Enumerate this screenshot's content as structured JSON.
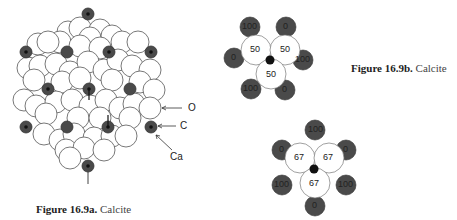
{
  "figure_a": {
    "caption_bold": "Figure 16.9a.",
    "caption_text": "Calcite",
    "labels": {
      "oxygen": "O",
      "carbon": "C",
      "calcium": "Ca"
    },
    "colors": {
      "oxygen_fill": "#ffffff",
      "oxygen_stroke": "#555555",
      "calcium_fill": "#4a4a4a",
      "carbon_fill": "#111111"
    }
  },
  "figure_b": {
    "caption_bold": "Figure 16.9b.",
    "caption_text": "Calcite",
    "top_diagram": {
      "oxygen_values": [
        "50",
        "50",
        "50"
      ],
      "calcium_values": [
        "100",
        "0",
        "0",
        "100",
        "100",
        "0"
      ]
    },
    "bottom_diagram": {
      "oxygen_values": [
        "67",
        "67",
        "67"
      ],
      "calcium_values": [
        "100",
        "0",
        "0",
        "100",
        "100",
        "0"
      ]
    }
  }
}
